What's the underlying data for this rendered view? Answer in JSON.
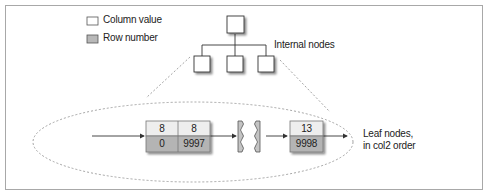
{
  "legend": {
    "items": [
      {
        "label": "Column value",
        "swatch_color": "#ffffff"
      },
      {
        "label": "Row number",
        "swatch_color": "#b8b8b8"
      }
    ]
  },
  "labels": {
    "internal_nodes": "Internal nodes",
    "leaf_nodes_line1": "Leaf nodes,",
    "leaf_nodes_line2": "in col2 order"
  },
  "leaf_nodes": [
    {
      "cells": [
        {
          "column_value": "8",
          "row_number": "0"
        },
        {
          "column_value": "8",
          "row_number": "9997"
        }
      ]
    },
    {
      "cells": [
        {
          "column_value": "13",
          "row_number": "9998"
        }
      ]
    }
  ],
  "colors": {
    "column_value_fill": "#eeeeee",
    "row_number_fill": "#b4b4b4",
    "border": "#777777",
    "dashed": "#9a9a9a"
  }
}
